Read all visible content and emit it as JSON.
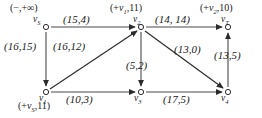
{
  "figure": {
    "nodes": [
      {
        "id": "vS",
        "label_main": "v",
        "label_sub": "S",
        "annotation_text": "(−,+∞)",
        "annot_prefix": "(−,+∞)",
        "annot_var": "",
        "annot_sub": "",
        "annot_suffix": "",
        "x": 46,
        "y": 27
      },
      {
        "id": "v2",
        "label_main": "v",
        "label_sub": "2",
        "annotation_text": "(+v₁,11)",
        "annot_prefix": "(+",
        "annot_var": "v",
        "annot_sub": "1",
        "annot_suffix": ",11)",
        "x": 141,
        "y": 27
      },
      {
        "id": "vT",
        "label_main": "v",
        "label_sub": "T",
        "annotation_text": "(+v₂,10)",
        "annot_prefix": "(+",
        "annot_var": "v",
        "annot_sub": "2",
        "annot_suffix": ",10)",
        "x": 228,
        "y": 27
      },
      {
        "id": "v1",
        "label_main": "v",
        "label_sub": "1",
        "annotation_text": "(+v_S,11)",
        "annot_prefix": "(+",
        "annot_var": "v",
        "annot_sub": "S",
        "annot_suffix": ",11)",
        "x": 46,
        "y": 92
      },
      {
        "id": "v3",
        "label_main": "v",
        "label_sub": "3",
        "annotation_text": "",
        "annot_prefix": "",
        "annot_var": "",
        "annot_sub": "",
        "annot_suffix": "",
        "x": 141,
        "y": 92
      },
      {
        "id": "v4",
        "label_main": "v",
        "label_sub": "4",
        "annotation_text": "",
        "annot_prefix": "",
        "annot_var": "",
        "annot_sub": "",
        "annot_suffix": "",
        "x": 228,
        "y": 92
      }
    ],
    "edges": [
      {
        "from": "vS",
        "to": "v2",
        "label": "(15,4)",
        "capacity": 15,
        "flow": 4
      },
      {
        "from": "vS",
        "to": "v1",
        "label": "(16,15)",
        "capacity": 16,
        "flow": 15
      },
      {
        "from": "v2",
        "to": "vT",
        "label": "(14, 14)",
        "capacity": 14,
        "flow": 14
      },
      {
        "from": "v1",
        "to": "v2",
        "label": "(16,12)",
        "capacity": 16,
        "flow": 12
      },
      {
        "from": "v2",
        "to": "v3",
        "label": "(5,2)",
        "capacity": 5,
        "flow": 2
      },
      {
        "from": "v2",
        "to": "v4",
        "label": "(13,0)",
        "capacity": 13,
        "flow": 0
      },
      {
        "from": "v4",
        "to": "vT",
        "label": "(13,5)",
        "capacity": 13,
        "flow": 5
      },
      {
        "from": "v1",
        "to": "v3",
        "label": "(10,3)",
        "capacity": 10,
        "flow": 3
      },
      {
        "from": "v3",
        "to": "v4",
        "label": "(17,5)",
        "capacity": 17,
        "flow": 5
      }
    ],
    "edge_labels": {
      "s_to_2": "(15,4)",
      "s_to_1": "(16,15)",
      "2_to_t": "(14, 14)",
      "1_to_2": "(16,12)",
      "2_to_3": "(5,2)",
      "2_to_4": "(13,0)",
      "4_to_t": "(13,5)",
      "1_to_3": "(10,3)",
      "3_to_4": "(17,5)"
    },
    "colors": {
      "edge": "#4a4a4a",
      "arrow": "#2b2b2b",
      "node_stroke": "#2b2b2b",
      "node_fill": "#ffffff",
      "text": "#1a1a1a"
    }
  }
}
